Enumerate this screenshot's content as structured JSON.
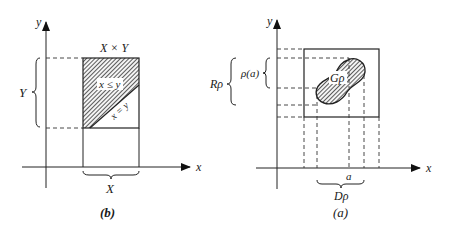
{
  "figure_b": {
    "caption": "(b)",
    "axis_x_label": "x",
    "axis_y_label": "y",
    "product_label": "X × Y",
    "region_label": "x ≤ y",
    "diagonal_label": "x = y",
    "brace_y_label": "Y",
    "brace_x_label": "X"
  },
  "figure_a": {
    "caption": "(a)",
    "axis_x_label": "x",
    "axis_y_label": "y",
    "graph_label": "Gρ",
    "point_label": "a",
    "image_label": "ρ(a)",
    "range_label": "Rρ",
    "domain_label": "Dρ"
  },
  "colors": {
    "ink": "#222222",
    "background": "#ffffff"
  }
}
